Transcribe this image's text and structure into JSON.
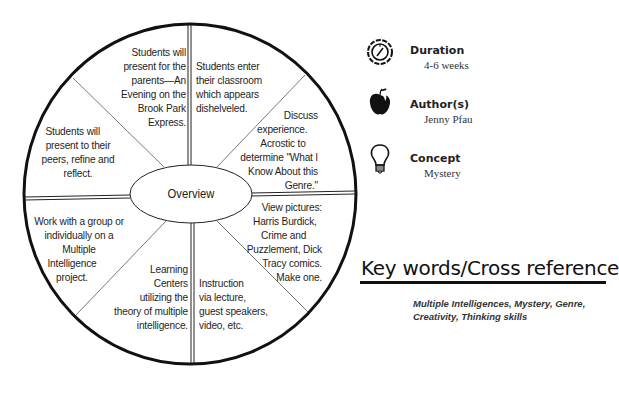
{
  "wheel": {
    "center_label": "Overview",
    "segments": [
      {
        "id": "top-left",
        "text": "Students will present for the parents—An Evening on the Brook Park Express."
      },
      {
        "id": "top-right",
        "text": "Students enter their classroom which appears dishelveled."
      },
      {
        "id": "upper-right",
        "text": "Discuss experience. Acrostic to determine \"What I Know About this Genre.\""
      },
      {
        "id": "lower-right",
        "text": "View pictures: Harris Burdick, Crime and Puzzlement, Dick Tracy comics. Make one."
      },
      {
        "id": "bottom-right",
        "text": "Instruction via lecture, guest speakers, video, etc."
      },
      {
        "id": "bottom-left",
        "text": "Learning Centers utilizing the theory of multiple intelligence."
      },
      {
        "id": "lower-left",
        "text": "Work with a group or individually on a Multiple Intelligence project."
      },
      {
        "id": "upper-left",
        "text": "Students will present to their peers, refine and reflect."
      }
    ],
    "segment_lines": {
      "top_left": [
        "Students will",
        "present for the",
        "parents—An",
        "Evening on the",
        "Brook Park",
        "Express."
      ],
      "top_right": [
        "Students enter",
        "their classroom",
        "which appears",
        "dishelveled."
      ],
      "upper_right": [
        "Discuss",
        "experience.",
        "Acrostic to",
        "determine \"What I",
        "Know About this",
        "Genre.\""
      ],
      "lower_right": [
        "View pictures:",
        "Harris Burdick,",
        "Crime and",
        "Puzzlement, Dick",
        "Tracy comics.",
        "Make one."
      ],
      "bottom_right": [
        "Instruction",
        "via lecture,",
        "guest speakers,",
        "video, etc."
      ],
      "bottom_left": [
        "Learning",
        "Centers",
        "utilizing the",
        "theory of multiple",
        "intelligence."
      ],
      "lower_left": [
        "Work with a group or",
        "individually on a",
        "Multiple",
        "Intelligence",
        "project."
      ],
      "upper_left": [
        "Students will",
        "present to their",
        "peers, refine and",
        "reflect."
      ]
    }
  },
  "info": {
    "duration": {
      "icon": "compass-clock-icon",
      "label": "Duration",
      "value": "4-6 weeks"
    },
    "authors": {
      "icon": "apple-icon",
      "label": "Author(s)",
      "value": "Jenny Pfau"
    },
    "concept": {
      "icon": "lightbulb-icon",
      "label": "Concept",
      "value": "Mystery"
    }
  },
  "keywords": {
    "title": "Key words/Cross reference",
    "line1": "Multiple Intelligences, Mystery, Genre,",
    "line2": "Creativity, Thinking skills"
  },
  "colors": {
    "ink": "#111111",
    "text": "#1e1e1e",
    "background": "#ffffff"
  }
}
